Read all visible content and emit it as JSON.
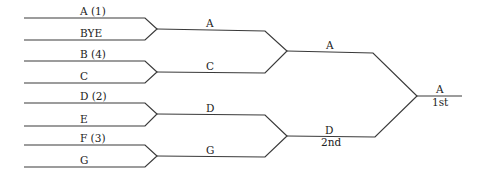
{
  "bracket": {
    "round1": [
      {
        "top": "A (1)",
        "bottom": "BYE"
      },
      {
        "top": "B (4)",
        "bottom": "C"
      },
      {
        "top": "D (2)",
        "bottom": "E"
      },
      {
        "top": "F (3)",
        "bottom": "G"
      }
    ],
    "round2": [
      "A",
      "C",
      "D",
      "G"
    ],
    "round3": [
      {
        "name": "A",
        "place": ""
      },
      {
        "name": "D",
        "place": "2nd"
      }
    ],
    "final": {
      "name": "A",
      "place": "1st"
    }
  },
  "colors": {
    "line": "#3a3a3a",
    "text": "#222222",
    "background": "#ffffff"
  }
}
